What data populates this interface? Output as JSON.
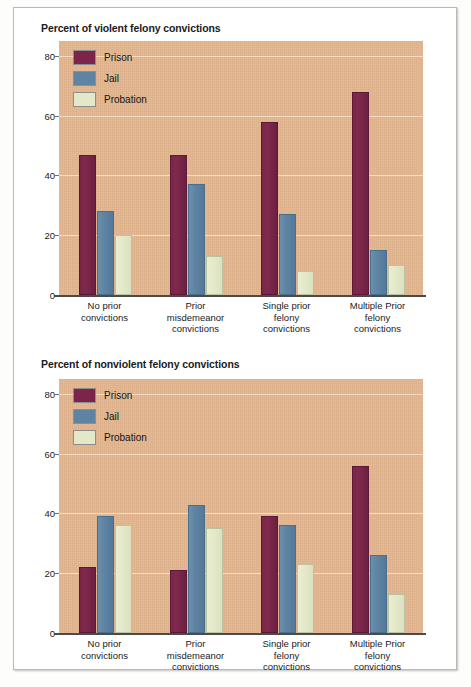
{
  "figure": {
    "background_color": "#ffffff",
    "plot_background_color": "#e3b68e",
    "gridline_color": "#f4ddc4",
    "axis_color": "#4a4a4a"
  },
  "legend": {
    "position": "top-left-inside-plot",
    "entries": [
      {
        "label": "Prison",
        "color": "#7c2449"
      },
      {
        "label": "Jail",
        "color": "#5f84a3"
      },
      {
        "label": "Probation",
        "color": "#e3e8c9"
      }
    ]
  },
  "chart_data": [
    {
      "id": "violent",
      "type": "bar",
      "title": "Percent of violent felony convictions",
      "xlabel": "",
      "ylabel": "",
      "ylim": [
        0,
        85
      ],
      "yticks": [
        0,
        20,
        40,
        60,
        80
      ],
      "ytick_labels": [
        "0",
        "20",
        "40",
        "60",
        "80"
      ],
      "grid": true,
      "legend_position": "upper left",
      "categories": [
        "No prior convictions",
        "Prior misdemeanor convictions",
        "Single prior felony convictions",
        "Multiple Prior felony convictions"
      ],
      "category_lines": [
        [
          "No prior",
          "convictions"
        ],
        [
          "Prior",
          "misdemeanor",
          "convictions"
        ],
        [
          "Single prior",
          "felony",
          "convictions"
        ],
        [
          "Multiple Prior",
          "felony",
          "convictions"
        ]
      ],
      "series": [
        {
          "name": "Prison",
          "color": "#7c2449",
          "values": [
            47,
            47,
            58,
            68
          ]
        },
        {
          "name": "Jail",
          "color": "#5f84a3",
          "values": [
            28,
            37,
            27,
            15
          ]
        },
        {
          "name": "Probation",
          "color": "#e3e8c9",
          "values": [
            20,
            13,
            8,
            10
          ]
        }
      ]
    },
    {
      "id": "nonviolent",
      "type": "bar",
      "title": "Percent of nonviolent felony convictions",
      "xlabel": "",
      "ylabel": "",
      "ylim": [
        0,
        85
      ],
      "yticks": [
        0,
        20,
        40,
        60,
        80
      ],
      "ytick_labels": [
        "0",
        "20",
        "40",
        "60",
        "80"
      ],
      "grid": true,
      "legend_position": "upper left",
      "categories": [
        "No prior convictions",
        "Prior misdemeanor convictions",
        "Single prior felony convictions",
        "Multiple Prior felony convictions"
      ],
      "category_lines": [
        [
          "No prior",
          "convictions"
        ],
        [
          "Prior",
          "misdemeanor",
          "convictions"
        ],
        [
          "Single prior",
          "felony",
          "convictions"
        ],
        [
          "Multiple Prior",
          "felony",
          "convictions"
        ]
      ],
      "series": [
        {
          "name": "Prison",
          "color": "#7c2449",
          "values": [
            22,
            21,
            39,
            56
          ]
        },
        {
          "name": "Jail",
          "color": "#5f84a3",
          "values": [
            39,
            43,
            36,
            26
          ]
        },
        {
          "name": "Probation",
          "color": "#e3e8c9",
          "values": [
            36,
            35,
            23,
            13
          ]
        }
      ]
    }
  ]
}
